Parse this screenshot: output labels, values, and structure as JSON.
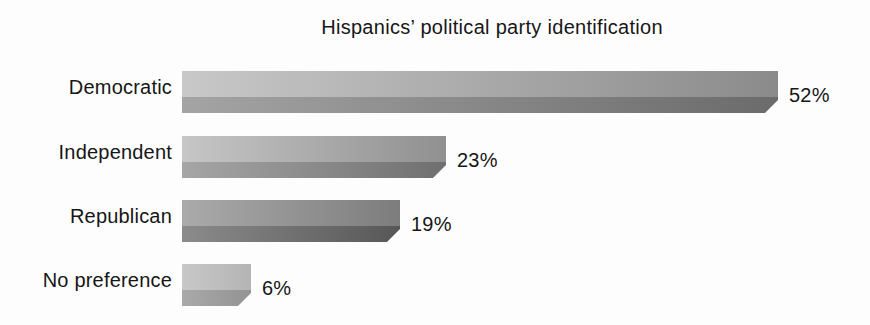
{
  "chart_data": {
    "type": "bar",
    "orientation": "horizontal",
    "title": "Hispanics’ political party identification",
    "categories": [
      "Democratic",
      "Independent",
      "Republican",
      "No preference"
    ],
    "values": [
      52,
      23,
      19,
      6
    ],
    "value_labels": [
      "52%",
      "23%",
      "19%",
      "6%"
    ],
    "xlabel": "",
    "ylabel": "",
    "xlim": [
      0,
      52
    ],
    "grid": false,
    "legend": "none",
    "bar_style": "3d-ribbon, beveled bottom-right corner, grayscale two-tone with left-to-right darkening",
    "bar_colors": [
      {
        "light_from": "#c8c8c8",
        "light_to": "#8b8b8b",
        "dark_from": "#a4a4a4",
        "dark_to": "#6b6b6b"
      },
      {
        "light_from": "#c6c6c6",
        "light_to": "#909090",
        "dark_from": "#a6a6a6",
        "dark_to": "#6f6f6f"
      },
      {
        "light_from": "#aaaaaa",
        "light_to": "#7d7d7d",
        "dark_from": "#8b8b8b",
        "dark_to": "#575757"
      },
      {
        "light_from": "#c8c8c8",
        "light_to": "#b4b4b4",
        "dark_from": "#a9a9a9",
        "dark_to": "#939393"
      }
    ],
    "text_color": "#1a1a1a",
    "background_color": "#fdfdfd"
  }
}
